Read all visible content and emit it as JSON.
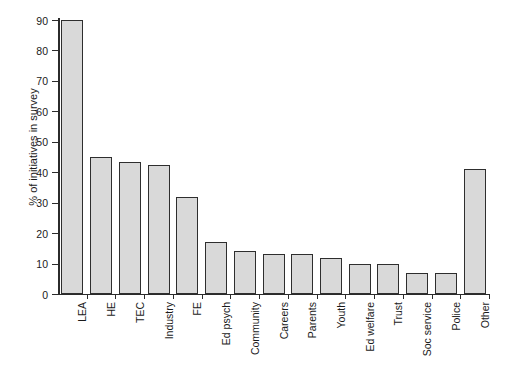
{
  "chart_data": {
    "type": "bar",
    "title": "",
    "xlabel": "",
    "ylabel": "% of initiatives in survey",
    "ylim": [
      0,
      90
    ],
    "yticks": [
      "0",
      "10",
      "20",
      "30",
      "40",
      "50",
      "60",
      "70",
      "80",
      "90"
    ],
    "ytick_values": [
      0,
      10,
      20,
      30,
      40,
      50,
      60,
      70,
      80,
      90
    ],
    "grid": false,
    "legend": "none",
    "bar_fill_color": "#d9d9d9",
    "bar_edge_color": "#2e2e2e",
    "axis_color": "#2b2b2b",
    "background_color": "#ffffff",
    "categories": [
      "LEA",
      "HE",
      "TEC",
      "Industry",
      "FE",
      "Ed psych",
      "Community",
      "Careers",
      "Parents",
      "Youth",
      "Ed welfare",
      "Trust",
      "Soc service",
      "Police",
      "Other"
    ],
    "values": [
      90,
      45,
      43.5,
      42.5,
      32,
      17.2,
      14,
      13,
      13,
      11.8,
      10,
      10,
      6.8,
      6.8,
      41
    ]
  }
}
